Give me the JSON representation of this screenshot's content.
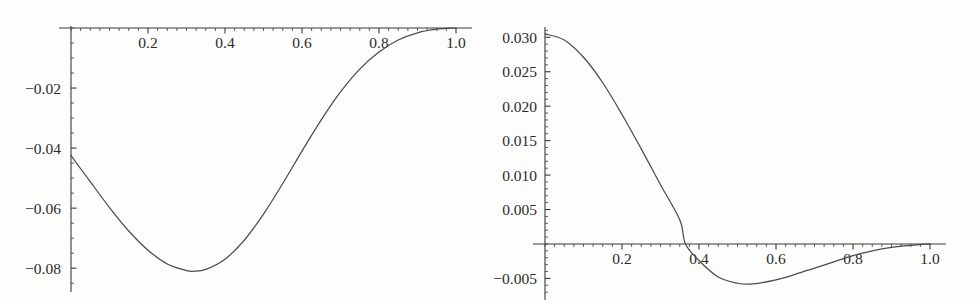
{
  "figure": {
    "background_color": "#fdfdfc",
    "curve_color": "#4b4b4b",
    "axis_color": "#3a3a3a",
    "panel_count": 2
  },
  "chart_data": [
    {
      "id": "left-plot",
      "type": "line",
      "title": "",
      "subtitle": "",
      "xlabel": "",
      "ylabel": "",
      "grid": false,
      "legend": null,
      "axis_position": {
        "x_axis_at_y": 0.0,
        "y_axis_at_x": 0.0
      },
      "xlim": [
        0.0,
        1.0
      ],
      "ylim": [
        -0.085,
        0.0
      ],
      "xticks": [
        0.2,
        0.4,
        0.6,
        0.8,
        1.0
      ],
      "xticklabels": [
        "0.2",
        "0.4",
        "0.6",
        "0.8",
        "1.0"
      ],
      "x_minor_tick_step": 0.025,
      "yticks": [
        -0.02,
        -0.04,
        -0.06,
        -0.08
      ],
      "yticklabels": [
        "−0.02",
        "−0.04",
        "−0.06",
        "−0.08"
      ],
      "y_minor_tick_step": 0.005,
      "x": [
        0.0,
        0.05,
        0.1,
        0.15,
        0.2,
        0.25,
        0.3,
        0.32,
        0.35,
        0.4,
        0.45,
        0.5,
        0.55,
        0.6,
        0.65,
        0.7,
        0.75,
        0.8,
        0.85,
        0.9,
        0.95,
        1.0
      ],
      "y": [
        -0.0425,
        -0.0512,
        -0.0598,
        -0.0676,
        -0.074,
        -0.0786,
        -0.0808,
        -0.081,
        -0.0804,
        -0.077,
        -0.0707,
        -0.062,
        -0.0518,
        -0.041,
        -0.0306,
        -0.0213,
        -0.0137,
        -0.008,
        -0.004,
        -0.0016,
        -0.0004,
        0.0
      ],
      "annotations": [
        {
          "text": "minimum",
          "x": 0.32,
          "y": -0.081
        },
        {
          "text": "start",
          "x": 0.0,
          "y": -0.0425
        },
        {
          "text": "end",
          "x": 1.0,
          "y": 0.0
        }
      ]
    },
    {
      "id": "right-plot",
      "type": "line",
      "title": "",
      "subtitle": "",
      "xlabel": "",
      "ylabel": "",
      "grid": false,
      "legend": null,
      "axis_position": {
        "x_axis_at_y": 0.0,
        "y_axis_at_x": 0.0
      },
      "xlim": [
        0.0,
        1.0
      ],
      "ylim": [
        -0.0075,
        0.0312
      ],
      "xticks": [
        0.2,
        0.4,
        0.6,
        0.8,
        1.0
      ],
      "xticklabels": [
        "0.2",
        "0.4",
        "0.6",
        "0.8",
        "1.0"
      ],
      "x_minor_tick_step": 0.025,
      "yticks": [
        0.03,
        0.025,
        0.02,
        0.015,
        0.01,
        0.005,
        -0.005
      ],
      "yticklabels": [
        "0.030",
        "0.025",
        "0.020",
        "0.015",
        "0.010",
        "0.005",
        "−0.005"
      ],
      "y_minor_tick_step": 0.001,
      "x": [
        0.0,
        0.05,
        0.1,
        0.15,
        0.2,
        0.25,
        0.3,
        0.35,
        0.365,
        0.4,
        0.45,
        0.5,
        0.54,
        0.6,
        0.65,
        0.7,
        0.75,
        0.8,
        0.85,
        0.9,
        0.95,
        1.0
      ],
      "y": [
        0.0305,
        0.0296,
        0.0271,
        0.0234,
        0.0188,
        0.0138,
        0.0086,
        0.0035,
        0.0,
        -0.0024,
        -0.0048,
        -0.0057,
        -0.0058,
        -0.0052,
        -0.0044,
        -0.0035,
        -0.0026,
        -0.0017,
        -0.001,
        -0.0005,
        -0.0002,
        0.0
      ],
      "annotations": [
        {
          "text": "zero-crossing",
          "x": 0.365,
          "y": 0.0
        },
        {
          "text": "minimum",
          "x": 0.54,
          "y": -0.0058
        },
        {
          "text": "start",
          "x": 0.0,
          "y": 0.0305
        }
      ]
    }
  ]
}
